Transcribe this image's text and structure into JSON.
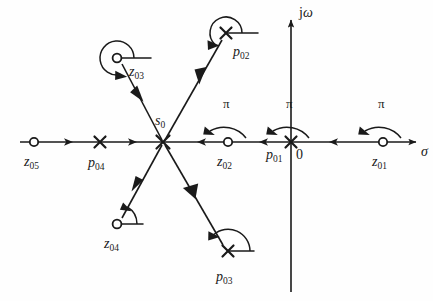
{
  "figure": {
    "type": "pole-zero-diagram",
    "background_color": "#fefefe",
    "ink_color": "#1a1a1a"
  },
  "axes": {
    "real": {
      "label": "σ",
      "label_x": 421,
      "label_y": 156,
      "y": 142,
      "x_start": 20,
      "x_end": 422,
      "arrow_at_right": true
    },
    "imaginary": {
      "label_part1": "j",
      "label_part2": "ω",
      "label_x": 299,
      "label_y": 17,
      "x": 291,
      "y_top": 14,
      "y_bottom": 292,
      "arrow_at_top": true
    },
    "origin": {
      "label": "0",
      "x": 291,
      "y": 142,
      "label_x": 296,
      "label_y": 159
    }
  },
  "test_point": {
    "name": "s0",
    "label_base": "s",
    "label_sub": "0",
    "x": 163,
    "y": 142,
    "label_x": 155,
    "label_y": 125
  },
  "markers": [
    {
      "id": "z05",
      "kind": "zero",
      "label_base": "z",
      "label_sub": "05",
      "x": 34,
      "y": 142,
      "label_x": 24,
      "label_y": 166,
      "on_real_axis": true
    },
    {
      "id": "p04",
      "kind": "pole",
      "label_base": "p",
      "label_sub": "04",
      "x": 100,
      "y": 142,
      "label_x": 88,
      "label_y": 167,
      "on_real_axis": true
    },
    {
      "id": "z02",
      "kind": "zero",
      "label_base": "z",
      "label_sub": "02",
      "x": 228,
      "y": 142,
      "label_x": 217,
      "label_y": 166,
      "on_real_axis": true
    },
    {
      "id": "p01",
      "kind": "pole",
      "label_base": "p",
      "label_sub": "01",
      "x": 291,
      "y": 142,
      "label_x": 268,
      "label_y": 159,
      "on_real_axis": true
    },
    {
      "id": "z01",
      "kind": "zero",
      "label_base": "z",
      "label_sub": "01",
      "x": 383,
      "y": 142,
      "label_x": 372,
      "label_y": 166,
      "on_real_axis": true
    },
    {
      "id": "z03",
      "kind": "zero",
      "label_base": "z",
      "label_sub": "03",
      "x": 117,
      "y": 58,
      "label_x": 129,
      "label_y": 76,
      "on_real_axis": false
    },
    {
      "id": "p02",
      "kind": "pole",
      "label_base": "p",
      "label_sub": "02",
      "x": 226,
      "y": 33,
      "label_x": 233,
      "label_y": 56,
      "on_real_axis": false
    },
    {
      "id": "z04",
      "kind": "zero",
      "label_base": "z",
      "label_sub": "04",
      "x": 117,
      "y": 224,
      "label_x": 104,
      "label_y": 248,
      "on_real_axis": false
    },
    {
      "id": "p03",
      "kind": "pole",
      "label_base": "p",
      "label_sub": "03",
      "x": 228,
      "y": 251,
      "label_x": 216,
      "label_y": 281,
      "on_real_axis": false
    }
  ],
  "vectors": [
    {
      "id": "z03-to-s0",
      "from": "z03",
      "to": "s0",
      "x1": 122,
      "y1": 64,
      "x2": 161,
      "y2": 139
    },
    {
      "id": "p02-to-s0",
      "from": "p02",
      "to": "s0",
      "x1": 222,
      "y1": 40,
      "x2": 166,
      "y2": 139
    },
    {
      "id": "z04-to-s0",
      "from": "z04",
      "to": "s0",
      "x1": 122,
      "y1": 218,
      "x2": 161,
      "y2": 146
    },
    {
      "id": "p03-to-s0",
      "from": "p03",
      "to": "s0",
      "x1": 223,
      "y1": 245,
      "x2": 166,
      "y2": 146
    }
  ],
  "angle_arcs": [
    {
      "id": "angle-z03",
      "center": "z03",
      "sweep_label": "",
      "radius": 17,
      "kind": "large"
    },
    {
      "id": "angle-p02",
      "center": "p02",
      "sweep_label": "",
      "radius": 16,
      "kind": "large"
    },
    {
      "id": "angle-z04",
      "center": "z04",
      "sweep_label": "",
      "radius": 20,
      "kind": "small"
    },
    {
      "id": "angle-p03",
      "center": "p03",
      "sweep_label": "",
      "radius": 22,
      "kind": "small"
    }
  ],
  "pi_arcs": [
    {
      "id": "pi-arc-z02",
      "label": "π",
      "center_x": 228,
      "label_x": 223,
      "label_y": 108
    },
    {
      "id": "pi-arc-p01",
      "label": "π",
      "center_x": 291,
      "label_x": 286,
      "label_y": 108
    },
    {
      "id": "pi-arc-z01",
      "label": "π",
      "center_x": 383,
      "label_x": 378,
      "label_y": 108
    }
  ],
  "axis_direction_arrows": [
    {
      "id": "axis-arrow-1",
      "x": 72,
      "y": 142,
      "direction": "right"
    },
    {
      "id": "axis-arrow-2",
      "x": 136,
      "y": 142,
      "direction": "right"
    },
    {
      "id": "axis-arrow-3",
      "x": 198,
      "y": 142,
      "direction": "left"
    },
    {
      "id": "axis-arrow-4",
      "x": 260,
      "y": 142,
      "direction": "left"
    },
    {
      "id": "axis-arrow-5",
      "x": 330,
      "y": 142,
      "direction": "left"
    }
  ]
}
